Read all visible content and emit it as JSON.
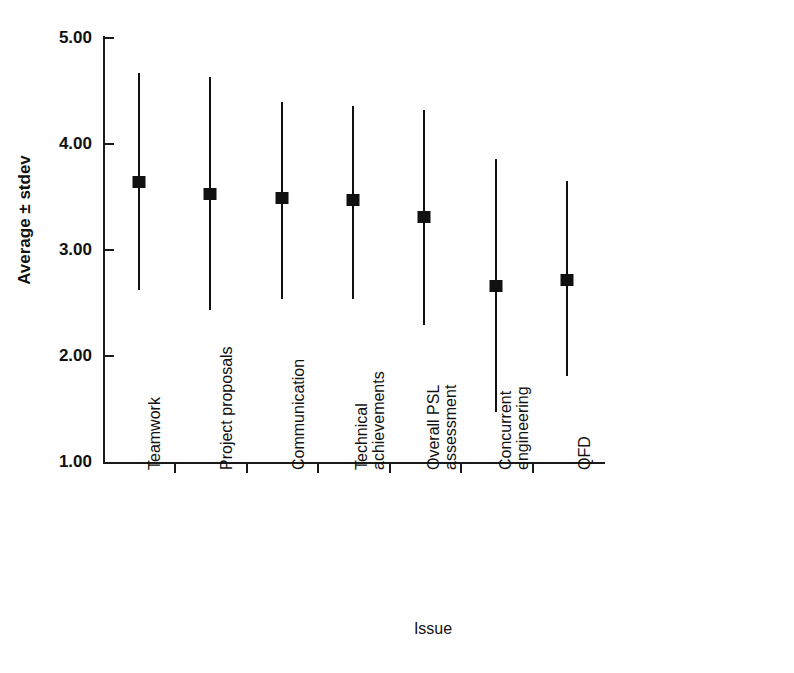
{
  "chart_data": {
    "type": "scatter",
    "title": "",
    "xlabel": "Issue",
    "ylabel": "Average ± stdev",
    "ylim": [
      1.0,
      5.0
    ],
    "ytick_labels": [
      "1.00",
      "2.00",
      "3.00",
      "4.00",
      "5.00"
    ],
    "ytick_values": [
      1.0,
      2.0,
      3.0,
      4.0,
      5.0
    ],
    "grid": false,
    "legend": "none",
    "error_bar_style": "vertical-line-with-square-marker",
    "categories": [
      "Teamwork",
      "Project proposals",
      "Communication",
      "Technical achievements",
      "Overall PSL assessment",
      "Concurrent engineering",
      "QFD"
    ],
    "category_label_lines": [
      [
        "Teamwork"
      ],
      [
        "Project proposals"
      ],
      [
        "Communication"
      ],
      [
        "Technical",
        "achievements"
      ],
      [
        "Overall PSL",
        "assessment"
      ],
      [
        "Concurrent",
        "engineering"
      ],
      [
        "QFD"
      ]
    ],
    "series": [
      {
        "name": "Average ± stdev",
        "values": [
          3.64,
          3.53,
          3.49,
          3.47,
          3.31,
          2.66,
          2.72
        ],
        "high": [
          4.67,
          4.63,
          4.4,
          4.36,
          4.32,
          3.86,
          3.65
        ],
        "low": [
          2.62,
          2.43,
          2.54,
          2.54,
          2.29,
          1.47,
          1.81
        ]
      }
    ],
    "colors": {
      "line": "#111111",
      "marker": "#111111",
      "axis": "#1a1a1a",
      "background": "#ffffff"
    }
  },
  "axis": {
    "y_title": "Average ± stdev",
    "x_title": "Issue",
    "y_ticks": [
      "5.00",
      "4.00",
      "3.00",
      "2.00",
      "1.00"
    ]
  },
  "categories": {
    "c0_l0": "Teamwork",
    "c1_l0": "Project proposals",
    "c2_l0": "Communication",
    "c3_l0": "Technical",
    "c3_l1": "achievements",
    "c4_l0": "Overall PSL",
    "c4_l1": "assessment",
    "c5_l0": "Concurrent",
    "c5_l1": "engineering",
    "c6_l0": "QFD"
  }
}
